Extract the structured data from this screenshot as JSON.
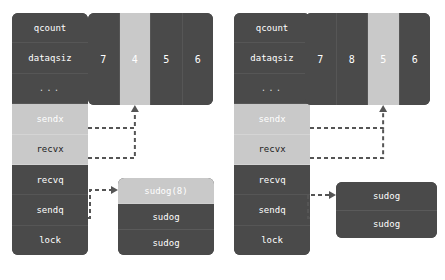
{
  "diagram": {
    "colors": {
      "block_dark": "#4a4a4a",
      "block_light": "#c9c9c9",
      "text_light": "#ffffff",
      "arrow": "#555555",
      "background": "#ffffff"
    }
  },
  "panels": [
    {
      "id": "before",
      "hchan": {
        "rows": [
          {
            "label": "qcount",
            "highlight": false
          },
          {
            "label": "dataqsiz",
            "highlight": false
          },
          {
            "label": "...",
            "highlight": false
          },
          {
            "label": "",
            "highlight": false
          },
          {
            "label": "sendx",
            "highlight": true
          },
          {
            "label": "recvx",
            "highlight": true
          },
          {
            "label": "recvq",
            "highlight": false
          },
          {
            "label": "sendq",
            "highlight": false
          },
          {
            "label": "lock",
            "highlight": false
          }
        ]
      },
      "buffer": {
        "cells": [
          {
            "value": "7",
            "highlight": false
          },
          {
            "value": "4",
            "highlight": true
          },
          {
            "value": "5",
            "highlight": false
          },
          {
            "value": "6",
            "highlight": false
          }
        ]
      },
      "sudog_list": {
        "items": [
          {
            "label": "sudog(8)",
            "highlight": true
          },
          {
            "label": "sudog",
            "highlight": false
          },
          {
            "label": "sudog",
            "highlight": false
          }
        ]
      }
    },
    {
      "id": "after",
      "hchan": {
        "rows": [
          {
            "label": "qcount",
            "highlight": false
          },
          {
            "label": "dataqsiz",
            "highlight": false
          },
          {
            "label": "...",
            "highlight": false
          },
          {
            "label": "",
            "highlight": false
          },
          {
            "label": "sendx",
            "highlight": true
          },
          {
            "label": "recvx",
            "highlight": true
          },
          {
            "label": "recvq",
            "highlight": false
          },
          {
            "label": "sendq",
            "highlight": false
          },
          {
            "label": "lock",
            "highlight": false
          }
        ]
      },
      "buffer": {
        "cells": [
          {
            "value": "7",
            "highlight": false
          },
          {
            "value": "8",
            "highlight": false
          },
          {
            "value": "5",
            "highlight": true
          },
          {
            "value": "6",
            "highlight": false
          }
        ]
      },
      "sudog_list": {
        "items": [
          {
            "label": "sudog",
            "highlight": false
          },
          {
            "label": "sudog",
            "highlight": false
          }
        ]
      }
    }
  ]
}
